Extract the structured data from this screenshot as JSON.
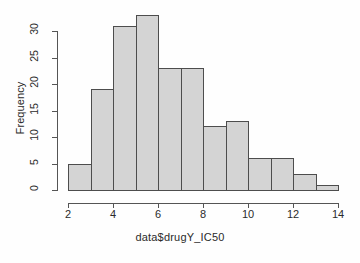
{
  "chart_data": {
    "type": "bar",
    "title": "",
    "subtitle": "",
    "xlabel": "data$drugY_IC50",
    "ylabel": "Frequency",
    "categories": [
      "2-3",
      "3-4",
      "4-5",
      "5-6",
      "6-7",
      "7-8",
      "8-9",
      "9-10",
      "10-11",
      "11-12",
      "12-13",
      "13-14"
    ],
    "bin_edges": [
      2,
      3,
      4,
      5,
      6,
      7,
      8,
      9,
      10,
      11,
      12,
      13,
      14
    ],
    "values": [
      5,
      19,
      31,
      33,
      23,
      23,
      12,
      13,
      6,
      6,
      3,
      1
    ],
    "bin_width": 1,
    "xlim": [
      2,
      14
    ],
    "ylim": [
      0,
      33
    ],
    "x_ticks": [
      2,
      4,
      6,
      8,
      10,
      12,
      14
    ],
    "x_tick_labels": [
      "2",
      "4",
      "6",
      "8",
      "10",
      "12",
      "14"
    ],
    "y_ticks": [
      0,
      5,
      10,
      15,
      20,
      25,
      30
    ],
    "y_tick_labels": [
      "0",
      "5",
      "10",
      "15",
      "20",
      "25",
      "30"
    ],
    "grid": false,
    "legend": false,
    "legend_position": "none",
    "bar_fill_color": "#d4d4d4",
    "bar_border_color": "#4d4d4d",
    "axis_color": "#555555",
    "background_color": "#ffffff",
    "text_color": "#2b2b2b"
  }
}
